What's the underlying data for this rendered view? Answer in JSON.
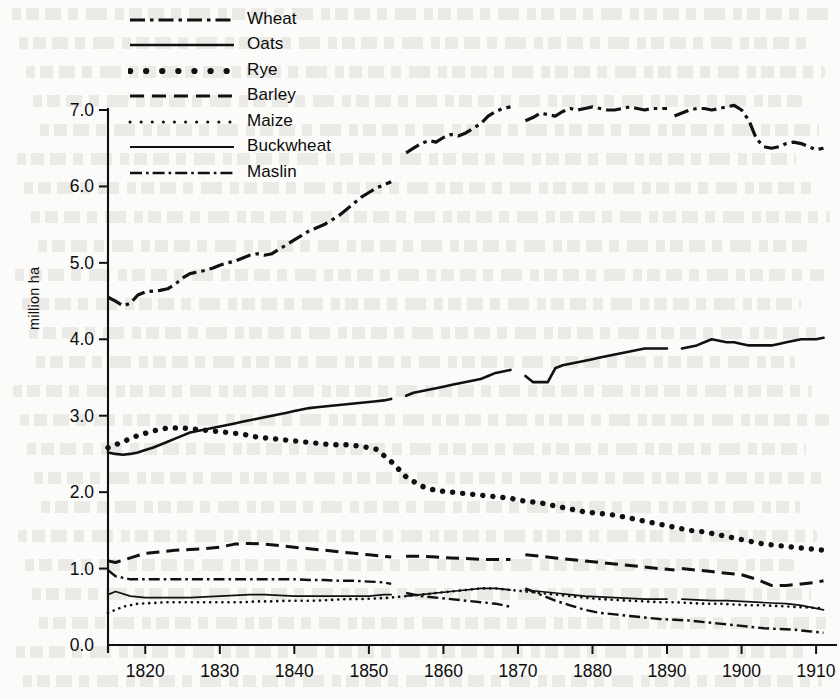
{
  "chart_data": {
    "type": "line",
    "title": "",
    "xlabel": "",
    "ylabel": "million ha",
    "xlim": [
      1815,
      1912
    ],
    "ylim": [
      0.0,
      7.0
    ],
    "grid": false,
    "legend_position": "top-left",
    "y_ticks": [
      "7.0",
      "6.0",
      "5.0",
      "4.0",
      "3.0",
      "2.0",
      "1.0",
      "0.0"
    ],
    "y_tick_values": [
      7.0,
      6.0,
      5.0,
      4.0,
      3.0,
      2.0,
      1.0,
      0.0
    ],
    "x_ticks": [
      "1820",
      "1830",
      "1840",
      "1850",
      "1860",
      "1870",
      "1880",
      "1890",
      "1900",
      "1910"
    ],
    "x_tick_values": [
      1820,
      1830,
      1840,
      1850,
      1860,
      1870,
      1880,
      1890,
      1900,
      1910
    ],
    "series": [
      {
        "name": "Wheat",
        "dash": "dashdot",
        "x": [
          1815,
          1816,
          1817,
          1818,
          1819,
          1820,
          1821,
          1822,
          1823,
          1824,
          1825,
          1826,
          1827,
          1828,
          1829,
          1830,
          1831,
          1832,
          1833,
          1834,
          1835,
          1836,
          1837,
          1838,
          1839,
          1840,
          1841,
          1842,
          1843,
          1844,
          1845,
          1846,
          1847,
          1848,
          1849,
          1850,
          1851,
          1852,
          1853,
          1855,
          1856,
          1857,
          1858,
          1859,
          1860,
          1861,
          1862,
          1863,
          1864,
          1865,
          1866,
          1867,
          1868,
          1869,
          1871,
          1872,
          1873,
          1874,
          1875,
          1876,
          1877,
          1878,
          1879,
          1880,
          1881,
          1882,
          1883,
          1884,
          1885,
          1886,
          1887,
          1888,
          1889,
          1890,
          1891,
          1892,
          1893,
          1894,
          1895,
          1896,
          1897,
          1898,
          1899,
          1900,
          1901,
          1902,
          1903,
          1904,
          1905,
          1906,
          1907,
          1908,
          1909,
          1910,
          1911
        ],
        "y": [
          4.55,
          4.5,
          4.44,
          4.47,
          4.58,
          4.62,
          4.63,
          4.64,
          4.66,
          4.72,
          4.8,
          4.86,
          4.88,
          4.9,
          4.93,
          4.97,
          5.0,
          5.02,
          5.06,
          5.1,
          5.12,
          5.1,
          5.12,
          5.18,
          5.24,
          5.3,
          5.36,
          5.42,
          5.46,
          5.5,
          5.56,
          5.62,
          5.7,
          5.78,
          5.86,
          5.92,
          5.98,
          6.02,
          6.06,
          6.44,
          6.5,
          6.56,
          6.6,
          6.58,
          6.64,
          6.68,
          6.66,
          6.7,
          6.76,
          6.82,
          6.92,
          6.98,
          7.02,
          7.04,
          6.86,
          6.9,
          6.96,
          6.94,
          6.92,
          6.98,
          7.02,
          7.0,
          7.02,
          7.04,
          7.02,
          7.0,
          7.0,
          7.02,
          7.04,
          7.02,
          7.0,
          7.02,
          7.02,
          7.02,
          6.92,
          6.96,
          7.0,
          7.02,
          7.02,
          7.0,
          7.02,
          7.04,
          7.06,
          7.0,
          6.86,
          6.62,
          6.52,
          6.5,
          6.52,
          6.56,
          6.58,
          6.56,
          6.52,
          6.48,
          6.5
        ],
        "gaps": [
          [
            1853,
            1855
          ],
          [
            1869,
            1871
          ],
          [
            1890,
            1891
          ]
        ]
      },
      {
        "name": "Oats",
        "dash": "solid",
        "x": [
          1815,
          1816,
          1817,
          1818,
          1819,
          1820,
          1821,
          1822,
          1823,
          1824,
          1825,
          1826,
          1827,
          1828,
          1829,
          1830,
          1831,
          1832,
          1833,
          1834,
          1835,
          1836,
          1837,
          1838,
          1839,
          1840,
          1841,
          1842,
          1843,
          1844,
          1845,
          1846,
          1847,
          1848,
          1849,
          1850,
          1851,
          1852,
          1853,
          1855,
          1856,
          1857,
          1858,
          1859,
          1860,
          1861,
          1862,
          1863,
          1864,
          1865,
          1866,
          1867,
          1868,
          1869,
          1871,
          1872,
          1873,
          1874,
          1875,
          1876,
          1877,
          1878,
          1879,
          1880,
          1881,
          1882,
          1883,
          1884,
          1885,
          1886,
          1887,
          1888,
          1889,
          1890,
          1892,
          1893,
          1894,
          1895,
          1896,
          1897,
          1898,
          1899,
          1900,
          1901,
          1902,
          1903,
          1904,
          1905,
          1906,
          1907,
          1908,
          1909,
          1910,
          1911
        ],
        "y": [
          2.52,
          2.5,
          2.49,
          2.5,
          2.52,
          2.55,
          2.58,
          2.62,
          2.66,
          2.7,
          2.74,
          2.78,
          2.8,
          2.82,
          2.84,
          2.86,
          2.88,
          2.9,
          2.92,
          2.94,
          2.96,
          2.98,
          3.0,
          3.02,
          3.04,
          3.06,
          3.08,
          3.1,
          3.11,
          3.12,
          3.13,
          3.14,
          3.15,
          3.16,
          3.17,
          3.18,
          3.19,
          3.2,
          3.22,
          3.26,
          3.3,
          3.32,
          3.34,
          3.36,
          3.38,
          3.4,
          3.42,
          3.44,
          3.46,
          3.48,
          3.52,
          3.56,
          3.58,
          3.6,
          3.52,
          3.44,
          3.44,
          3.44,
          3.62,
          3.66,
          3.68,
          3.7,
          3.72,
          3.74,
          3.76,
          3.78,
          3.8,
          3.82,
          3.84,
          3.86,
          3.88,
          3.88,
          3.88,
          3.88,
          3.88,
          3.9,
          3.92,
          3.96,
          4.0,
          3.98,
          3.96,
          3.96,
          3.94,
          3.92,
          3.92,
          3.92,
          3.92,
          3.94,
          3.96,
          3.98,
          4.0,
          4.0,
          4.0,
          4.02
        ],
        "gaps": [
          [
            1853,
            1855
          ],
          [
            1869,
            1871
          ],
          [
            1890,
            1892
          ]
        ]
      },
      {
        "name": "Rye",
        "dash": "dotted-large",
        "x": [
          1815,
          1817,
          1819,
          1821,
          1823,
          1825,
          1827,
          1829,
          1831,
          1833,
          1835,
          1837,
          1839,
          1841,
          1843,
          1845,
          1847,
          1849,
          1851,
          1853,
          1855,
          1857,
          1859,
          1861,
          1863,
          1865,
          1867,
          1869,
          1871,
          1873,
          1875,
          1877,
          1879,
          1881,
          1883,
          1885,
          1887,
          1889,
          1891,
          1893,
          1895,
          1897,
          1899,
          1901,
          1903,
          1905,
          1907,
          1909,
          1911
        ],
        "y": [
          2.58,
          2.66,
          2.74,
          2.8,
          2.84,
          2.84,
          2.82,
          2.8,
          2.78,
          2.76,
          2.72,
          2.7,
          2.68,
          2.66,
          2.64,
          2.62,
          2.62,
          2.6,
          2.56,
          2.4,
          2.2,
          2.08,
          2.02,
          2.0,
          1.98,
          1.96,
          1.94,
          1.92,
          1.88,
          1.86,
          1.82,
          1.78,
          1.74,
          1.72,
          1.7,
          1.66,
          1.62,
          1.58,
          1.54,
          1.5,
          1.48,
          1.44,
          1.4,
          1.36,
          1.32,
          1.3,
          1.28,
          1.26,
          1.24
        ],
        "gaps": []
      },
      {
        "name": "Barley",
        "dash": "dashed",
        "x": [
          1815,
          1816,
          1818,
          1820,
          1822,
          1824,
          1826,
          1828,
          1830,
          1832,
          1834,
          1836,
          1838,
          1840,
          1842,
          1844,
          1846,
          1848,
          1850,
          1852,
          1853,
          1855,
          1857,
          1859,
          1861,
          1863,
          1865,
          1867,
          1869,
          1871,
          1873,
          1875,
          1877,
          1879,
          1881,
          1883,
          1885,
          1887,
          1889,
          1891,
          1892,
          1894,
          1896,
          1898,
          1900,
          1902,
          1904,
          1906,
          1908,
          1910,
          1911
        ],
        "y": [
          1.1,
          1.08,
          1.14,
          1.2,
          1.22,
          1.24,
          1.25,
          1.26,
          1.28,
          1.32,
          1.33,
          1.32,
          1.3,
          1.28,
          1.26,
          1.24,
          1.22,
          1.2,
          1.18,
          1.16,
          1.15,
          1.16,
          1.16,
          1.15,
          1.14,
          1.13,
          1.12,
          1.12,
          1.12,
          1.18,
          1.16,
          1.14,
          1.12,
          1.1,
          1.08,
          1.06,
          1.04,
          1.02,
          1.0,
          0.98,
          1.0,
          0.98,
          0.96,
          0.94,
          0.92,
          0.86,
          0.78,
          0.78,
          0.8,
          0.82,
          0.84
        ],
        "gaps": [
          [
            1853,
            1855
          ],
          [
            1869,
            1871
          ],
          [
            1891,
            1892
          ]
        ]
      },
      {
        "name": "Maize",
        "dash": "dotted-small",
        "x": [
          1815,
          1817,
          1819,
          1821,
          1823,
          1825,
          1827,
          1829,
          1831,
          1833,
          1835,
          1837,
          1839,
          1841,
          1843,
          1845,
          1847,
          1849,
          1851,
          1853,
          1855,
          1857,
          1859,
          1861,
          1863,
          1865,
          1867,
          1869,
          1871,
          1873,
          1875,
          1877,
          1879,
          1881,
          1883,
          1885,
          1887,
          1889,
          1891,
          1893,
          1895,
          1897,
          1899,
          1901,
          1903,
          1905,
          1907,
          1909,
          1911
        ],
        "y": [
          0.42,
          0.5,
          0.54,
          0.55,
          0.56,
          0.56,
          0.56,
          0.56,
          0.56,
          0.56,
          0.57,
          0.57,
          0.58,
          0.58,
          0.58,
          0.59,
          0.6,
          0.6,
          0.61,
          0.62,
          0.64,
          0.66,
          0.68,
          0.7,
          0.72,
          0.74,
          0.74,
          0.72,
          0.7,
          0.68,
          0.66,
          0.64,
          0.62,
          0.6,
          0.59,
          0.58,
          0.57,
          0.56,
          0.56,
          0.55,
          0.54,
          0.54,
          0.53,
          0.52,
          0.52,
          0.51,
          0.5,
          0.49,
          0.48
        ],
        "gaps": []
      },
      {
        "name": "Buckwheat",
        "dash": "solid-thin",
        "x": [
          1815,
          1816,
          1818,
          1820,
          1822,
          1824,
          1826,
          1828,
          1830,
          1832,
          1834,
          1836,
          1838,
          1840,
          1842,
          1844,
          1846,
          1848,
          1850,
          1852,
          1853,
          1855,
          1857,
          1859,
          1861,
          1863,
          1865,
          1867,
          1869,
          1871,
          1873,
          1875,
          1877,
          1879,
          1881,
          1883,
          1885,
          1887,
          1889,
          1890,
          1892,
          1894,
          1896,
          1898,
          1900,
          1902,
          1904,
          1906,
          1908,
          1910,
          1911
        ],
        "y": [
          0.66,
          0.7,
          0.64,
          0.62,
          0.62,
          0.62,
          0.62,
          0.63,
          0.64,
          0.65,
          0.66,
          0.66,
          0.65,
          0.64,
          0.64,
          0.64,
          0.64,
          0.64,
          0.64,
          0.66,
          0.66,
          0.64,
          0.66,
          0.68,
          0.7,
          0.72,
          0.74,
          0.74,
          0.72,
          0.72,
          0.7,
          0.68,
          0.66,
          0.64,
          0.63,
          0.62,
          0.61,
          0.6,
          0.6,
          0.6,
          0.6,
          0.59,
          0.58,
          0.58,
          0.57,
          0.56,
          0.55,
          0.54,
          0.52,
          0.48,
          0.46
        ],
        "gaps": [
          [
            1853,
            1855
          ],
          [
            1869,
            1871
          ],
          [
            1890,
            1892
          ]
        ]
      },
      {
        "name": "Maslin",
        "dash": "dashdot-small",
        "x": [
          1815,
          1816,
          1818,
          1820,
          1822,
          1824,
          1826,
          1828,
          1830,
          1832,
          1834,
          1836,
          1838,
          1840,
          1842,
          1844,
          1846,
          1848,
          1850,
          1852,
          1853,
          1855,
          1857,
          1859,
          1861,
          1863,
          1865,
          1867,
          1869,
          1871,
          1873,
          1875,
          1877,
          1879,
          1881,
          1883,
          1885,
          1887,
          1889,
          1891,
          1893,
          1895,
          1897,
          1899,
          1901,
          1903,
          1905,
          1907,
          1909,
          1911
        ],
        "y": [
          0.98,
          0.9,
          0.86,
          0.86,
          0.86,
          0.86,
          0.86,
          0.86,
          0.86,
          0.86,
          0.86,
          0.86,
          0.86,
          0.86,
          0.85,
          0.85,
          0.84,
          0.84,
          0.83,
          0.82,
          0.8,
          0.68,
          0.64,
          0.62,
          0.6,
          0.58,
          0.56,
          0.54,
          0.5,
          0.74,
          0.66,
          0.58,
          0.52,
          0.46,
          0.42,
          0.4,
          0.38,
          0.36,
          0.34,
          0.33,
          0.32,
          0.3,
          0.28,
          0.26,
          0.24,
          0.22,
          0.21,
          0.2,
          0.18,
          0.16
        ],
        "gaps": [
          [
            1853,
            1855
          ],
          [
            1869,
            1871
          ]
        ]
      }
    ]
  },
  "legend": {
    "items": [
      {
        "label": "Wheat"
      },
      {
        "label": "Oats"
      },
      {
        "label": "Rye"
      },
      {
        "label": "Barley"
      },
      {
        "label": "Maize"
      },
      {
        "label": "Buckwheat"
      },
      {
        "label": "Maslin"
      }
    ]
  },
  "axes": {
    "y_label": "million ha"
  },
  "colors": {
    "ink": "#0d0d0d",
    "paper": "#fbfbf9"
  }
}
